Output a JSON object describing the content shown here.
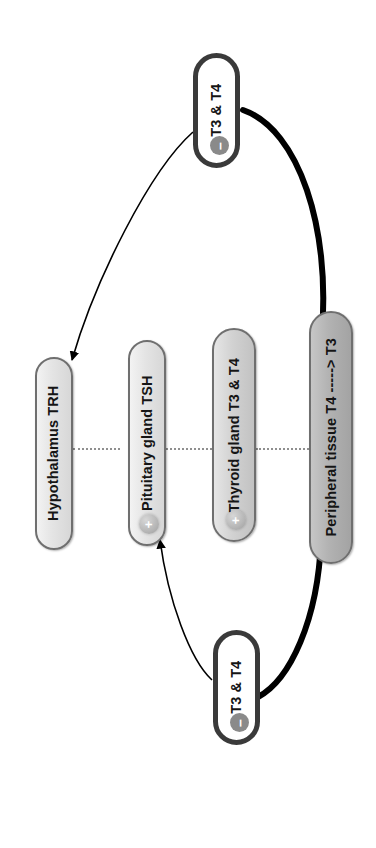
{
  "diagram": {
    "orientation": "rotated-90",
    "background_color": "#ffffff",
    "accent_colors": {
      "axis_node_border": "#6f6f6f",
      "hormone_node_border": "#3a3a3a",
      "edge_stroke": "#000000",
      "dotted_line": "#8f8f8f",
      "badge_plus": "#b6b6b6",
      "badge_minus": "#8a8a8a"
    }
  },
  "axis_nodes": [
    {
      "id": "hypothalamus",
      "label": "Hypothalamus TRH",
      "fill": "light",
      "badge": null
    },
    {
      "id": "pituitary",
      "label": "Pituitary gland TSH",
      "fill": "light",
      "badge": "+"
    },
    {
      "id": "thyroid",
      "label": "Thyroid gland T3 & T4",
      "fill": "mid",
      "badge": "+"
    },
    {
      "id": "peripheral",
      "label": "Peripheral tissue T4 -----> T3",
      "fill": "dark",
      "badge": null
    }
  ],
  "hormone_nodes": [
    {
      "id": "hormone-top",
      "label": "T3 & T4",
      "badge": "–"
    },
    {
      "id": "hormone-bottom",
      "label": "T3 & T4",
      "badge": "–"
    }
  ],
  "edges": [
    {
      "id": "peripheral-to-top-hormone",
      "from": "peripheral",
      "to": "hormone-top",
      "style": "thick",
      "arrow": false
    },
    {
      "id": "top-hormone-to-hypothalamus",
      "from": "hormone-top",
      "to": "hypothalamus",
      "style": "thin",
      "arrow": true
    },
    {
      "id": "peripheral-to-bottom-hormone",
      "from": "peripheral",
      "to": "hormone-bottom",
      "style": "thick",
      "arrow": false
    },
    {
      "id": "bottom-hormone-to-pituitary",
      "from": "hormone-bottom",
      "to": "pituitary",
      "style": "thin",
      "arrow": true
    }
  ]
}
